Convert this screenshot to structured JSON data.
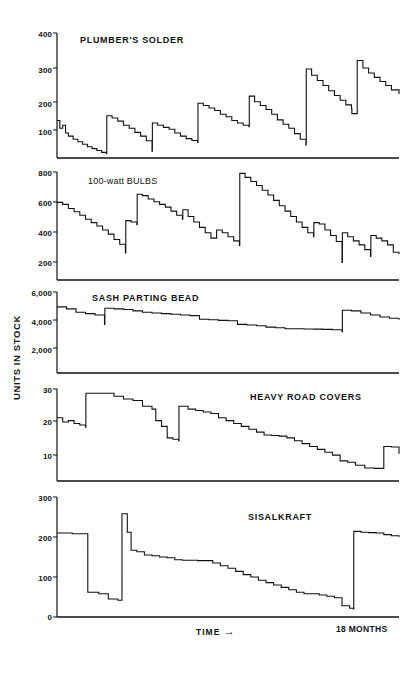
{
  "figure": {
    "y_axis_label": "UNITS IN STOCK",
    "x_axis_label": "TIME",
    "x_axis_arrow": "→",
    "x_axis_end_label": "18 MONTHS"
  },
  "chart_data": [
    {
      "type": "line",
      "title": "PLUMBER'S SOLDER",
      "xlabel": "TIME",
      "ylabel": "UNITS IN STOCK",
      "ylim": [
        0,
        400
      ],
      "yticks": [
        100,
        200,
        300,
        400
      ],
      "xlim": [
        0,
        18
      ],
      "grid": false,
      "legend": "none",
      "step_style": "post",
      "x": [
        0.0,
        0.15,
        0.3,
        0.45,
        0.6,
        0.85,
        1.1,
        1.35,
        1.6,
        1.85,
        2.1,
        2.35,
        2.6,
        2.62,
        2.9,
        3.2,
        3.5,
        3.8,
        4.1,
        4.4,
        4.7,
        5.0,
        5.02,
        5.3,
        5.6,
        5.9,
        6.2,
        6.5,
        6.8,
        7.1,
        7.4,
        7.42,
        7.7,
        8.0,
        8.3,
        8.6,
        8.9,
        9.2,
        9.5,
        9.8,
        10.1,
        10.12,
        10.4,
        10.7,
        11.0,
        11.3,
        11.6,
        11.9,
        12.2,
        12.5,
        12.8,
        13.1,
        13.12,
        13.4,
        13.7,
        14.0,
        14.3,
        14.6,
        14.9,
        15.2,
        15.5,
        15.52,
        15.8,
        16.1,
        16.4,
        16.7,
        17.0,
        17.3,
        17.6,
        18.0
      ],
      "y": [
        120,
        95,
        105,
        80,
        70,
        60,
        52,
        44,
        36,
        30,
        24,
        18,
        14,
        135,
        128,
        118,
        105,
        95,
        82,
        70,
        55,
        22,
        112,
        105,
        98,
        92,
        80,
        70,
        62,
        56,
        50,
        175,
        168,
        160,
        152,
        140,
        132,
        120,
        112,
        105,
        100,
        198,
        180,
        168,
        155,
        140,
        122,
        108,
        95,
        78,
        60,
        42,
        285,
        265,
        248,
        232,
        215,
        200,
        185,
        170,
        158,
        142,
        312,
        288,
        272,
        258,
        245,
        232,
        218,
        205
      ],
      "description": "Sawtooth inventory depletion with periodic replenishment spikes"
    },
    {
      "type": "line",
      "title": "100-watt BULBS",
      "xlabel": "TIME",
      "ylabel": "UNITS IN STOCK",
      "ylim": [
        0,
        800
      ],
      "yticks": [
        200,
        400,
        600,
        800
      ],
      "xlim": [
        0,
        18
      ],
      "grid": false,
      "legend": "none",
      "step_style": "post",
      "x": [
        0.0,
        0.3,
        0.6,
        0.9,
        1.2,
        1.5,
        1.8,
        2.1,
        2.4,
        2.7,
        3.0,
        3.3,
        3.6,
        3.62,
        3.9,
        4.2,
        4.22,
        4.5,
        4.8,
        5.1,
        5.4,
        5.7,
        6.0,
        6.3,
        6.6,
        6.62,
        6.9,
        7.2,
        7.5,
        7.8,
        8.1,
        8.4,
        8.7,
        9.0,
        9.3,
        9.6,
        9.62,
        9.9,
        10.2,
        10.5,
        10.8,
        11.1,
        11.4,
        11.7,
        12.0,
        12.3,
        12.6,
        12.9,
        13.2,
        13.5,
        13.52,
        13.8,
        14.1,
        14.4,
        14.7,
        15.0,
        15.02,
        15.3,
        15.6,
        15.9,
        16.2,
        16.5,
        16.52,
        16.8,
        17.1,
        17.4,
        17.7,
        18.0
      ],
      "y": [
        575,
        560,
        530,
        505,
        480,
        450,
        425,
        400,
        370,
        340,
        300,
        265,
        200,
        440,
        430,
        410,
        635,
        625,
        600,
        580,
        560,
        540,
        510,
        480,
        450,
        520,
        470,
        430,
        390,
        350,
        310,
        370,
        350,
        320,
        290,
        255,
        790,
        760,
        730,
        700,
        665,
        630,
        590,
        550,
        510,
        470,
        430,
        390,
        350,
        320,
        425,
        415,
        370,
        330,
        285,
        130,
        350,
        320,
        290,
        260,
        225,
        175,
        330,
        310,
        290,
        260,
        205,
        190
      ],
      "description": "Sawtooth inventory depletion with periodic replenishment spikes"
    },
    {
      "type": "line",
      "title": "SASH PARTING BEAD",
      "xlabel": "TIME",
      "ylabel": "UNITS IN STOCK",
      "ylim": [
        0,
        6000
      ],
      "yticks": [
        2000,
        4000,
        6000
      ],
      "xlim": [
        0,
        18
      ],
      "grid": false,
      "legend": "none",
      "step_style": "post",
      "x": [
        0.0,
        0.5,
        1.0,
        1.5,
        2.0,
        2.5,
        2.52,
        3.0,
        3.5,
        4.0,
        4.5,
        5.0,
        5.5,
        6.0,
        6.5,
        7.0,
        7.5,
        8.0,
        8.5,
        9.0,
        9.5,
        10.0,
        10.5,
        11.0,
        11.5,
        12.0,
        12.5,
        13.0,
        13.5,
        14.0,
        14.5,
        15.0,
        15.02,
        15.5,
        16.0,
        16.5,
        17.0,
        17.5,
        18.0
      ],
      "y": [
        4900,
        4750,
        4500,
        4400,
        4300,
        3600,
        4800,
        4750,
        4700,
        4600,
        4500,
        4450,
        4400,
        4350,
        4300,
        4250,
        3980,
        3950,
        3900,
        3870,
        3600,
        3550,
        3500,
        3400,
        3350,
        3280,
        3280,
        3260,
        3250,
        3230,
        3200,
        3050,
        4650,
        4600,
        4450,
        4300,
        4150,
        4050,
        3950
      ],
      "description": "Slow depletion with occasional restock"
    },
    {
      "type": "line",
      "title": "HEAVY ROAD COVERS",
      "xlabel": "TIME",
      "ylabel": "UNITS IN STOCK",
      "ylim": [
        0,
        32
      ],
      "yticks": [
        10,
        20,
        30
      ],
      "xlim": [
        0,
        18
      ],
      "grid": false,
      "legend": "none",
      "step_style": "post",
      "x": [
        0.0,
        0.3,
        0.6,
        0.9,
        1.2,
        1.5,
        1.52,
        2.0,
        2.5,
        3.0,
        3.5,
        4.0,
        4.5,
        5.0,
        5.2,
        5.5,
        5.8,
        6.1,
        6.4,
        6.42,
        6.9,
        7.3,
        7.7,
        8.1,
        8.5,
        8.9,
        9.3,
        9.7,
        10.1,
        10.5,
        10.9,
        11.3,
        11.7,
        12.1,
        12.5,
        12.9,
        13.3,
        13.7,
        14.1,
        14.5,
        14.9,
        15.3,
        15.7,
        15.72,
        16.2,
        16.7,
        17.2,
        17.6,
        18.0
      ],
      "y": [
        22,
        20.5,
        21,
        20,
        19.5,
        18.7,
        30.5,
        30.5,
        30.5,
        29.5,
        28.5,
        28,
        26,
        25,
        21,
        19,
        15,
        14.5,
        14,
        26,
        25,
        24.5,
        24,
        23.5,
        22,
        21,
        20,
        19,
        18,
        17,
        16,
        15.8,
        15.6,
        15,
        14,
        13,
        12,
        11,
        10,
        9,
        7,
        6.5,
        6,
        5.5,
        4.5,
        4.4,
        12,
        11.8,
        9.5
      ],
      "description": "Sawtooth inventory depletion with periodic replenishment spikes"
    },
    {
      "type": "line",
      "title": "SISALKRAFT",
      "xlabel": "TIME",
      "ylabel": "UNITS IN STOCK",
      "ylim": [
        0,
        300
      ],
      "yticks": [
        0,
        100,
        200,
        300
      ],
      "xlim": [
        0,
        18
      ],
      "grid": false,
      "legend": "none",
      "step_style": "post",
      "x": [
        0.0,
        0.8,
        1.6,
        1.62,
        2.2,
        2.7,
        3.2,
        3.4,
        3.42,
        3.7,
        3.9,
        4.2,
        4.6,
        5.0,
        5.4,
        5.8,
        6.2,
        6.6,
        7.0,
        7.4,
        7.8,
        8.2,
        8.6,
        9.0,
        9.4,
        9.8,
        10.2,
        10.6,
        11.0,
        11.4,
        11.8,
        12.2,
        12.6,
        13.0,
        13.4,
        13.8,
        14.2,
        14.6,
        15.0,
        15.4,
        15.6,
        15.62,
        16.0,
        16.4,
        16.8,
        17.2,
        17.6,
        18.0
      ],
      "y": [
        210,
        208,
        208,
        62,
        58,
        45,
        42,
        42,
        258,
        212,
        167,
        163,
        155,
        153,
        150,
        148,
        143,
        142,
        142,
        141,
        141,
        135,
        128,
        122,
        114,
        106,
        100,
        92,
        86,
        80,
        74,
        68,
        62,
        58,
        58,
        55,
        52,
        48,
        28,
        22,
        20,
        214,
        212,
        211,
        210,
        206,
        203,
        200
      ],
      "description": "Sawtooth inventory depletion with periodic replenishment spikes"
    }
  ],
  "panels": [
    {
      "title": "PLUMBER'S SOLDER",
      "tick_labels": [
        "400",
        "300",
        "200",
        "100"
      ]
    },
    {
      "title": "100-watt BULBS",
      "tick_labels": [
        "800",
        "600",
        "400",
        "200"
      ]
    },
    {
      "title": "SASH PARTING BEAD",
      "tick_labels": [
        "6,000",
        "4,000",
        "2,000"
      ]
    },
    {
      "title": "HEAVY ROAD COVERS",
      "tick_labels": [
        "30",
        "20",
        "10"
      ]
    },
    {
      "title": "SISALKRAFT",
      "tick_labels": [
        "300",
        "200",
        "100",
        "0"
      ]
    }
  ]
}
